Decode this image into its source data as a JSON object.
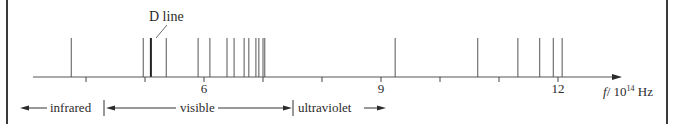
{
  "diagram": {
    "title": "",
    "annotation": {
      "text": "D line",
      "target_frequency": 5.1
    },
    "axis": {
      "label_var": "f",
      "label_unit": "/ 10",
      "label_exp": "14",
      "label_suffix": " Hz",
      "ticks": [
        4,
        5,
        6,
        7,
        8,
        9,
        10,
        11,
        12
      ],
      "tick_labels": [
        {
          "value": 6,
          "text": "6"
        },
        {
          "value": 9,
          "text": "9"
        },
        {
          "value": 12,
          "text": "12"
        }
      ]
    },
    "spectral_lines": [
      3.75,
      4.97,
      5.1,
      5.36,
      5.9,
      6.1,
      6.39,
      6.51,
      6.68,
      6.76,
      6.88,
      6.93,
      7.0,
      7.03,
      9.24,
      10.64,
      11.32,
      11.69,
      11.92,
      12.07
    ],
    "bands": [
      {
        "name": "infrared",
        "label": "infrared"
      },
      {
        "name": "visible",
        "label": "visible"
      },
      {
        "name": "ultraviolet",
        "label": "ultraviolet"
      }
    ],
    "colors": {
      "ink": "#2b2b2b",
      "line": "#555555",
      "frame": "#3a3a3a"
    }
  }
}
